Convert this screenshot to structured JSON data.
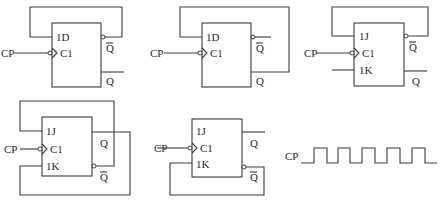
{
  "diagram": {
    "type": "flip-flop circuits",
    "circuits": [
      {
        "id": "a",
        "type": "D flip-flop",
        "inputs": [
          "1D",
          "C1"
        ],
        "clock_label": "CP",
        "outputs": [
          "Q̄",
          "Q"
        ],
        "clock_edge": "falling (inverted bubble)",
        "feedback": "Q̄ → 1D"
      },
      {
        "id": "b",
        "type": "D flip-flop",
        "inputs": [
          "1D",
          "C1"
        ],
        "clock_label": "CP",
        "outputs": [
          "Q̄",
          "Q"
        ],
        "clock_edge": "falling (inverted bubble)",
        "feedback": "Q → 1D"
      },
      {
        "id": "c",
        "type": "JK flip-flop",
        "inputs": [
          "1J",
          "C1",
          "1K"
        ],
        "clock_label": "CP",
        "outputs": [
          "Q̄",
          "Q"
        ],
        "clock_edge": "falling (inverted bubble)",
        "feedback": "Q̄ → 1J; 1K open input"
      },
      {
        "id": "d",
        "type": "JK flip-flop",
        "inputs": [
          "1J",
          "C1",
          "1K"
        ],
        "clock_label": "CP",
        "outputs": [
          "Q",
          "Q̄"
        ],
        "clock_edge": "falling (inverted bubble)",
        "feedback": "Q̄ → 1J; Q → 1K"
      },
      {
        "id": "e",
        "type": "JK flip-flop",
        "inputs": [
          "1J",
          "C1",
          "1K"
        ],
        "clock_label": "CP",
        "outputs": [
          "Q",
          "Q̄"
        ],
        "clock_edge": "falling (inverted bubble)",
        "feedback": "Q̄ → 1K; 1J unconnected"
      }
    ],
    "waveform": {
      "label": "CP",
      "pulses": 5
    }
  },
  "labels": {
    "d": "1D",
    "j": "1J",
    "k": "1K",
    "c": "C1",
    "q": "Q",
    "qbar": "Q",
    "cp": "CP"
  }
}
